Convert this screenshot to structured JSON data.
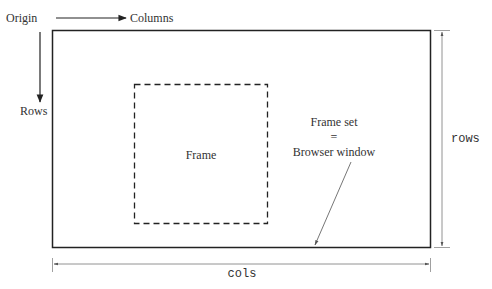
{
  "diagram": {
    "labels": {
      "origin": "Origin",
      "columns": "Columns",
      "rows": "Rows",
      "frame": "Frame",
      "frameset_line1": "Frame set",
      "frameset_line2": "=",
      "frameset_line3": "Browser window",
      "rows_dimension": "rows",
      "cols_dimension": "cols"
    },
    "colors": {
      "stroke": "#222222",
      "dimension_stroke": "#777777",
      "text": "#333333"
    }
  }
}
